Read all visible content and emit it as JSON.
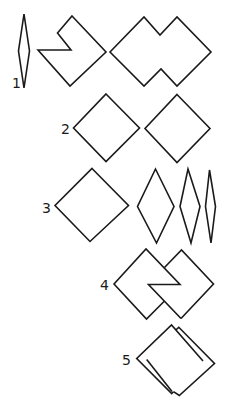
{
  "diagram": {
    "background": "#ffffff",
    "stroke_color": "#1a1a1a",
    "rows": [
      {
        "label": "1",
        "label_pos": [
          12,
          88
        ],
        "description": "thin vertical rhombus, notched square, double-peaked merged shape",
        "shapes": [
          {
            "name": "thin-rhombus",
            "points": "24,14 29.5,51 24,88 18.5,51"
          },
          {
            "name": "notched-square",
            "points": "72,16 106,52 70,86 38,50 71,50 57.5,33"
          },
          {
            "name": "double-square-merged",
            "points": "110,52 144,17 160,35 177,17 211,52 177,86 161,69 144,86"
          }
        ]
      },
      {
        "label": "2",
        "label_pos": [
          61,
          134
        ],
        "description": "two separate squares rotated 45 degrees",
        "shapes": [
          {
            "name": "square-a",
            "points": "106,94 139.5,128 106,161.5 73.5,128"
          },
          {
            "name": "square-b",
            "points": "177,94.5 210,128.5 177,162.5 145,128.5"
          }
        ]
      },
      {
        "label": "3",
        "label_pos": [
          42,
          213
        ],
        "description": "square followed by progressively narrower rhombi",
        "shapes": [
          {
            "name": "square",
            "points": "92,168.5 128.5,205.5 90,241.5 55,205.5"
          },
          {
            "name": "rhombus-wide",
            "points": "155.5,169 174,206.5 156.5,243 137.5,206.5"
          },
          {
            "name": "rhombus-medium",
            "points": "188,169 200,206.5 191,243 180,206.5"
          },
          {
            "name": "rhombus-narrow",
            "points": "209.5,170 215.5,206.5 211,243 205.5,206.5"
          }
        ]
      },
      {
        "label": "4",
        "label_pos": [
          100,
          290
        ],
        "description": "two interlocking squares",
        "shapes": [
          {
            "name": "interlock-left-outline",
            "points": "164,301.5 146.5,319 114,284 146,249 180,284.5 148.5,284.5 181,318.5",
            "open": true
          },
          {
            "name": "interlock-right-outline",
            "points": "164.5,267.5 181.5,250 213.5,284 181,318.5",
            "open": true
          }
        ]
      },
      {
        "label": "5",
        "label_pos": [
          122,
          365
        ],
        "description": "two overlapping offset squares",
        "shapes": [
          {
            "name": "front-square-outline",
            "points": "203,361 171.5,325 136.7,358.5 171.7,393.5 173.5,391.7",
            "open": true
          },
          {
            "name": "back-square-outline",
            "points": "175.7,330 178.8,327.3 214.5,363.5 179.3,395.5 173.5,391.7",
            "open": true
          },
          {
            "name": "inner-line-lower",
            "points": "146.7,359.5 172,391.5",
            "open": true
          }
        ]
      }
    ]
  }
}
